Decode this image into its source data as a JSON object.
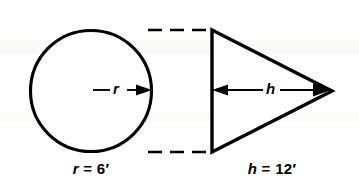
{
  "figure": {
    "background_color": "#ffffff",
    "stroke_color": "#000000"
  },
  "circle": {
    "name": "base-circle",
    "center_x": 91,
    "center_y": 91,
    "radius": 61,
    "radius_symbol": "r",
    "radius_arrow": "arrow pointing right from center to circumference"
  },
  "triangle": {
    "name": "cross-section-triangle",
    "left_x": 212,
    "top_y": 30,
    "bottom_y": 152,
    "apex_x": 332,
    "apex_y": 91,
    "height_symbol": "h",
    "height_arrow": "double headed arrow from left edge to apex"
  },
  "dashed_lines": {
    "name": "tangent-guide-lines",
    "top_y": 30,
    "bottom_y": 152,
    "start_x": 148,
    "end_x": 212,
    "dash": "14 8"
  },
  "labels": {
    "radius": {
      "variable": "r",
      "equals": " = ",
      "value": "6",
      "unit": "′",
      "full": "r = 6′"
    },
    "height": {
      "variable": "h",
      "equals": " = ",
      "value": "12",
      "unit": "′",
      "full": "h = 12′"
    }
  }
}
